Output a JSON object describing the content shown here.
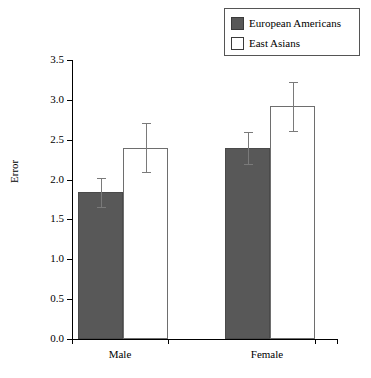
{
  "chart_data": {
    "type": "bar",
    "title": "",
    "xlabel": "",
    "ylabel": "Error",
    "categories": [
      "Male",
      "Female"
    ],
    "ylim": [
      0.0,
      3.5
    ],
    "ytick_labels": [
      "0.0",
      "0.5",
      "1.0",
      "1.5",
      "2.0",
      "2.5",
      "3.0",
      "3.5"
    ],
    "ytick_values": [
      0.0,
      0.5,
      1.0,
      1.5,
      2.0,
      2.5,
      3.0,
      3.5
    ],
    "grid": false,
    "legend_position": "top-right",
    "error_bar_type": "symmetric",
    "series": [
      {
        "name": "European Americans",
        "color": "#585858",
        "values": [
          1.84,
          2.4
        ],
        "errors": [
          0.18,
          0.2
        ]
      },
      {
        "name": "East Asians",
        "color": "#ffffff",
        "values": [
          2.4,
          2.92
        ],
        "errors": [
          0.31,
          0.31
        ]
      }
    ]
  },
  "legend": {
    "items": [
      {
        "label": "European Americans",
        "swatch": "dark"
      },
      {
        "label": "East Asians",
        "swatch": "light"
      }
    ]
  },
  "axes": {
    "y_title": "Error",
    "x_categories": [
      "Male",
      "Female"
    ]
  }
}
